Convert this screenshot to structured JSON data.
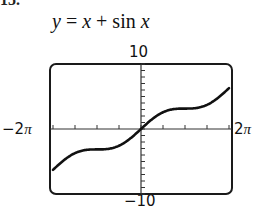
{
  "problem_number": "15.",
  "title": {
    "lhs": "y",
    "eq": " = ",
    "x1": "x",
    "plus": " + sin ",
    "x2": "x"
  },
  "window": {
    "ymax_label": "10",
    "ymin_label": "−10",
    "xmin_label": "−2",
    "xmax_label": "2",
    "pi_symbol": "π"
  },
  "chart_data": {
    "type": "line",
    "title": "y = x + sin x",
    "function": "x + sin(x)",
    "xlabel": "",
    "ylabel": "",
    "xlim": [
      -6.2832,
      6.2832
    ],
    "ylim": [
      -10,
      10
    ],
    "x_tick_labels": [
      "−2π",
      "2π"
    ],
    "y_tick_labels": [
      "−10",
      "10"
    ],
    "x_scale": 1.5708,
    "y_scale": 1,
    "grid": false,
    "legend": "none",
    "series": [
      {
        "name": "y = x + sin x",
        "x": [
          -6.2832,
          -5.4978,
          -4.7124,
          -3.927,
          -3.1416,
          -2.3562,
          -1.5708,
          -0.7854,
          0,
          0.7854,
          1.5708,
          2.3562,
          3.1416,
          3.927,
          4.7124,
          5.4978,
          6.2832
        ],
        "y": [
          -6.28,
          -4.79,
          -3.71,
          -3.22,
          -3.14,
          -3.06,
          -2.57,
          -1.49,
          0,
          1.49,
          2.57,
          3.06,
          3.14,
          3.22,
          3.71,
          4.79,
          6.28
        ]
      }
    ]
  }
}
